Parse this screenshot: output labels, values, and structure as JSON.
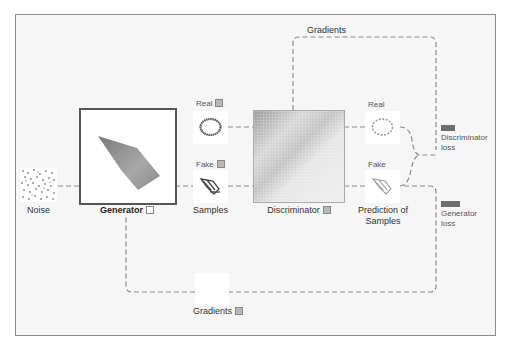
{
  "diagram": {
    "top_gradients_label": "Gradients",
    "noise": {
      "label": "Noise"
    },
    "generator": {
      "label": "Generator",
      "checkbox_checked": false
    },
    "real_input": {
      "label": "Real",
      "checkbox_checked": true
    },
    "fake_input": {
      "label": "Fake",
      "checkbox_checked": true
    },
    "samples": {
      "label": "Samples"
    },
    "discriminator": {
      "label": "Discriminator",
      "checkbox_checked": true
    },
    "prediction_real": {
      "label": "Real"
    },
    "prediction_fake": {
      "label": "Fake"
    },
    "prediction": {
      "label_line1": "Prediction of",
      "label_line2": "Samples"
    },
    "discriminator_loss": {
      "label_line1": "Discriminator",
      "label_line2": "loss",
      "bar_color": "#6e6e6e"
    },
    "generator_loss": {
      "label_line1": "Generator",
      "label_line2": "loss",
      "bar_color": "#6e6e6e"
    },
    "bottom_gradients": {
      "label": "Gradients",
      "checkbox_checked": true
    }
  },
  "colors": {
    "frame_border": "#8c8c8c",
    "frame_background": "#f6f6f6",
    "wire": "#8a8a8a",
    "generator_border": "#555555"
  }
}
